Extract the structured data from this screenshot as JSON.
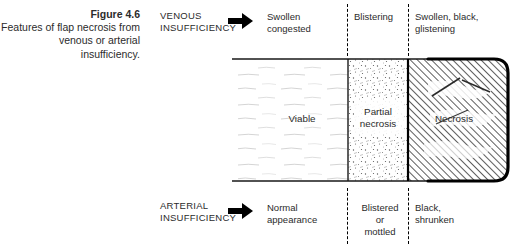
{
  "figure": {
    "caption_title": "Figure 4.6",
    "caption_body": "Features of flap\nnecrosis from venous\nor arterial\ninsufficiency."
  },
  "rows": {
    "venous": {
      "label": "VENOUS\nINSUFFICIENCY",
      "arrow_icon": "right-arrow-icon",
      "columns": [
        "Swollen\ncongested",
        "Blistering",
        "Swollen, black,\nglistening"
      ]
    },
    "arterial": {
      "label": "ARTERIAL\nINSUFFICIENCY",
      "arrow_icon": "right-arrow-icon",
      "columns": [
        "Normal\nappearance",
        "Blistered\nor\nmottled",
        "Black,\nshrunken"
      ]
    }
  },
  "flap": {
    "zones": [
      {
        "name": "viable",
        "label": "Viable",
        "texture": "blank-with-faint-strokes"
      },
      {
        "name": "partial-necrosis",
        "label": "Partial\nnecrosis",
        "texture": "stippled"
      },
      {
        "name": "necrosis",
        "label": "Necrosis",
        "texture": "dense-diagonal-hatching"
      }
    ]
  },
  "colors": {
    "ink": "#231f20",
    "text": "#2b2b2b",
    "hatch": "#4a4a4a",
    "faint": "#b9b9b9",
    "background": "#ffffff"
  }
}
